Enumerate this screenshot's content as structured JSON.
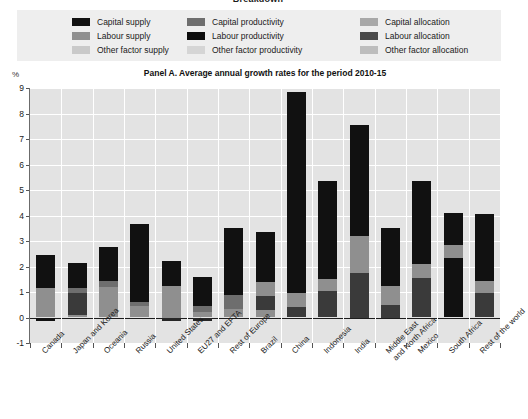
{
  "top_title": "Breakdown",
  "legend": {
    "rows": [
      [
        {
          "label": "Capital supply",
          "color": "#111111"
        },
        {
          "label": "Capital productivity",
          "color": "#6e6e6e"
        },
        {
          "label": "Capital allocation",
          "color": "#a8a8a8"
        }
      ],
      [
        {
          "label": "Labour supply",
          "color": "#8f8f8f"
        },
        {
          "label": "Labour productivity",
          "color": "#0d0d0d"
        },
        {
          "label": "Labour allocation",
          "color": "#4a4a4a"
        }
      ],
      [
        {
          "label": "Other factor supply",
          "color": "#c9c9c9"
        },
        {
          "label": "Other factor productivity",
          "color": "#d5d5d5"
        },
        {
          "label": "Other factor allocation",
          "color": "#bdbdbd"
        }
      ]
    ]
  },
  "panel_title": "Panel A. Average annual growth rates for the period 2010-15",
  "y_unit": "%",
  "chart_data": {
    "type": "bar",
    "subtype": "stacked",
    "title": "Panel A. Average annual growth rates for the period 2010-15",
    "xlabel": "",
    "ylabel": "%",
    "ylim": [
      -1,
      9
    ],
    "yticks": [
      -1,
      0,
      1,
      2,
      3,
      4,
      5,
      6,
      7,
      8,
      9
    ],
    "grid": true,
    "legend_position": "top",
    "categories": [
      "Canada",
      "Japan and Korea",
      "Oceania",
      "Russia",
      "United States",
      "EU27 and EFTA",
      "Rest of Europe",
      "Brazil",
      "China",
      "Indonesia",
      "India",
      "Middle East and North Africa",
      "Mexico",
      "South Africa",
      "Rest of the world"
    ],
    "series": [
      {
        "name": "Labour supply",
        "color": "#8f8f8f",
        "values": [
          1.15,
          0.55,
          1.2,
          0.45,
          0.45,
          0.1,
          0.35,
          0.85,
          0.0,
          1.05,
          0.9,
          1.55,
          1.1,
          0.0,
          0.75
        ]
      },
      {
        "name": "Capital productivity",
        "color": "#6e6e6e",
        "values": [
          0.0,
          0.35,
          0.35,
          0.15,
          0.0,
          0.25,
          0.55,
          0.55,
          0.55,
          0.45,
          1.45,
          0.75,
          0.55,
          0.25,
          0.35
        ]
      },
      {
        "name": "Capital supply",
        "color": "#111111",
        "values": [
          1.4,
          1.3,
          1.2,
          3.05,
          1.8,
          1.25,
          2.6,
          1.95,
          8.3,
          3.85,
          5.25,
          1.3,
          3.7,
          1.6,
          2.95
        ]
      },
      {
        "name": "Labour productivity (negative)",
        "color": "#0d0d0d",
        "values": [
          -0.1,
          0.0,
          0.0,
          0.0,
          -0.08,
          -0.05,
          0.0,
          0.0,
          -0.1,
          0.0,
          0.0,
          0.0,
          0.0,
          0.0,
          0.0
        ]
      }
    ],
    "totals": [
      2.45,
      2.15,
      2.75,
      3.65,
      2.2,
      1.6,
      3.5,
      3.35,
      8.85,
      5.35,
      7.55,
      3.5,
      5.35,
      4.1,
      4.05
    ]
  },
  "bars": [
    {
      "label": "Canada",
      "segments": [
        {
          "name": "labour-supply",
          "color": "#8f8f8f",
          "from": 0.0,
          "to": 1.15
        },
        {
          "name": "capital-supply",
          "color": "#111111",
          "from": 1.15,
          "to": 2.45
        },
        {
          "name": "negative-seg",
          "color": "#111111",
          "from": -0.15,
          "to": 0.0
        }
      ]
    },
    {
      "label": "Japan and Korea",
      "segments": [
        {
          "name": "labour-supply",
          "color": "#8f8f8f",
          "from": 0.0,
          "to": 0.1
        },
        {
          "name": "capital-allocation",
          "color": "#3a3a3a",
          "from": 0.1,
          "to": 0.95
        },
        {
          "name": "capital-productivity",
          "color": "#6e6e6e",
          "from": 0.95,
          "to": 1.15
        },
        {
          "name": "capital-supply",
          "color": "#111111",
          "from": 1.15,
          "to": 2.15
        }
      ]
    },
    {
      "label": "Oceania",
      "segments": [
        {
          "name": "labour-supply",
          "color": "#8f8f8f",
          "from": 0.0,
          "to": 1.2
        },
        {
          "name": "capital-productivity",
          "color": "#6e6e6e",
          "from": 1.2,
          "to": 1.45
        },
        {
          "name": "capital-supply",
          "color": "#111111",
          "from": 1.45,
          "to": 2.75
        }
      ]
    },
    {
      "label": "Russia",
      "segments": [
        {
          "name": "labour-supply",
          "color": "#8f8f8f",
          "from": 0.0,
          "to": 0.45
        },
        {
          "name": "capital-productivity",
          "color": "#6e6e6e",
          "from": 0.45,
          "to": 0.6
        },
        {
          "name": "capital-supply",
          "color": "#111111",
          "from": 0.6,
          "to": 3.65
        }
      ]
    },
    {
      "label": "United States",
      "segments": [
        {
          "name": "labour-supply",
          "color": "#8f8f8f",
          "from": 0.0,
          "to": 1.25
        },
        {
          "name": "capital-supply",
          "color": "#111111",
          "from": 1.25,
          "to": 2.2
        },
        {
          "name": "negative-seg",
          "color": "#262626",
          "from": -0.15,
          "to": 0.0
        }
      ]
    },
    {
      "label": "EU27 and EFTA",
      "segments": [
        {
          "name": "labour-supply",
          "color": "#8f8f8f",
          "from": 0.0,
          "to": 0.2
        },
        {
          "name": "capital-productivity",
          "color": "#6e6e6e",
          "from": 0.2,
          "to": 0.45
        },
        {
          "name": "capital-supply",
          "color": "#111111",
          "from": 0.45,
          "to": 1.6
        },
        {
          "name": "negative-seg",
          "color": "#262626",
          "from": -0.12,
          "to": 0.0
        }
      ]
    },
    {
      "label": "Rest of Europe",
      "segments": [
        {
          "name": "labour-supply",
          "color": "#8f8f8f",
          "from": 0.0,
          "to": 0.35
        },
        {
          "name": "capital-productivity",
          "color": "#6e6e6e",
          "from": 0.35,
          "to": 0.9
        },
        {
          "name": "capital-supply",
          "color": "#111111",
          "from": 0.9,
          "to": 3.5
        }
      ]
    },
    {
      "label": "Brazil",
      "segments": [
        {
          "name": "labour-supply",
          "color": "#8f8f8f",
          "from": 0.0,
          "to": 0.3
        },
        {
          "name": "capital-allocation",
          "color": "#3a3a3a",
          "from": 0.3,
          "to": 0.85
        },
        {
          "name": "capital-productivity",
          "color": "#8f8f8f",
          "from": 0.85,
          "to": 1.4
        },
        {
          "name": "capital-supply",
          "color": "#111111",
          "from": 1.4,
          "to": 3.35
        }
      ]
    },
    {
      "label": "China",
      "segments": [
        {
          "name": "labour-supply",
          "color": "#3a3a3a",
          "from": 0.0,
          "to": 0.4
        },
        {
          "name": "capital-productivity",
          "color": "#8f8f8f",
          "from": 0.4,
          "to": 0.95
        },
        {
          "name": "capital-supply",
          "color": "#111111",
          "from": 0.95,
          "to": 8.85
        }
      ]
    },
    {
      "label": "Indonesia",
      "segments": [
        {
          "name": "labour-supply",
          "color": "#3a3a3a",
          "from": 0.0,
          "to": 1.05
        },
        {
          "name": "capital-productivity",
          "color": "#8f8f8f",
          "from": 1.05,
          "to": 1.5
        },
        {
          "name": "capital-supply",
          "color": "#111111",
          "from": 1.5,
          "to": 5.35
        }
      ]
    },
    {
      "label": "India",
      "segments": [
        {
          "name": "labour-supply",
          "color": "#3a3a3a",
          "from": 0.0,
          "to": 1.75
        },
        {
          "name": "capital-productivity",
          "color": "#8f8f8f",
          "from": 1.75,
          "to": 3.2
        },
        {
          "name": "capital-supply",
          "color": "#111111",
          "from": 3.2,
          "to": 7.55
        }
      ]
    },
    {
      "label": "Middle East and North Africa",
      "segments": [
        {
          "name": "labour-supply",
          "color": "#3a3a3a",
          "from": 0.0,
          "to": 0.5
        },
        {
          "name": "capital-productivity",
          "color": "#8f8f8f",
          "from": 0.5,
          "to": 1.25
        },
        {
          "name": "capital-supply",
          "color": "#111111",
          "from": 1.25,
          "to": 3.5
        }
      ]
    },
    {
      "label": "Mexico",
      "segments": [
        {
          "name": "labour-supply",
          "color": "#3a3a3a",
          "from": 0.0,
          "to": 1.55
        },
        {
          "name": "capital-productivity",
          "color": "#8f8f8f",
          "from": 1.55,
          "to": 2.1
        },
        {
          "name": "capital-supply",
          "color": "#111111",
          "from": 2.1,
          "to": 5.35
        }
      ]
    },
    {
      "label": "South Africa",
      "segments": [
        {
          "name": "labour-supply",
          "color": "#111111",
          "from": 0.0,
          "to": 2.35
        },
        {
          "name": "capital-productivity",
          "color": "#8f8f8f",
          "from": 2.35,
          "to": 2.85
        },
        {
          "name": "capital-supply",
          "color": "#111111",
          "from": 2.85,
          "to": 4.1
        }
      ]
    },
    {
      "label": "Rest of the world",
      "segments": [
        {
          "name": "labour-supply",
          "color": "#3a3a3a",
          "from": 0.0,
          "to": 0.95
        },
        {
          "name": "capital-productivity",
          "color": "#8f8f8f",
          "from": 0.95,
          "to": 1.45
        },
        {
          "name": "capital-supply",
          "color": "#111111",
          "from": 1.45,
          "to": 4.05
        }
      ]
    }
  ]
}
